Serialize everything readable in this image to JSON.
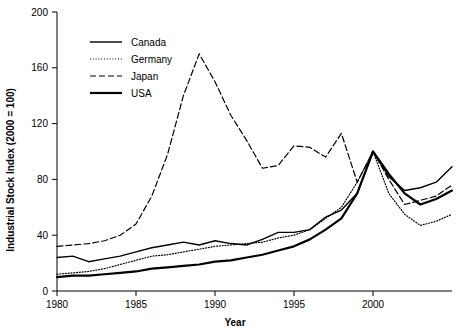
{
  "chart_data": {
    "type": "line",
    "title": "",
    "xlabel": "Year",
    "ylabel": "Industrial Stock Index (2000 = 100)",
    "xlim": [
      1980,
      2005
    ],
    "ylim": [
      0,
      200
    ],
    "xticks": [
      1980,
      1985,
      1990,
      1995,
      2000
    ],
    "yticks": [
      0,
      40,
      80,
      120,
      160,
      200
    ],
    "grid": false,
    "legend_position": "top-left",
    "x": [
      1980,
      1981,
      1982,
      1983,
      1984,
      1985,
      1986,
      1987,
      1988,
      1989,
      1990,
      1991,
      1992,
      1993,
      1994,
      1995,
      1996,
      1997,
      1998,
      1999,
      2000,
      2001,
      2002,
      2003,
      2004,
      2005
    ],
    "series": [
      {
        "name": "Canada",
        "style": "solid",
        "values": [
          24,
          25,
          21,
          23,
          25,
          28,
          31,
          33,
          35,
          33,
          36,
          34,
          33,
          37,
          42,
          42,
          44,
          53,
          58,
          70,
          100,
          82,
          72,
          74,
          78,
          89
        ]
      },
      {
        "name": "Germany",
        "style": "dotted",
        "values": [
          12,
          13,
          14,
          16,
          19,
          22,
          25,
          26,
          28,
          30,
          32,
          33,
          34,
          35,
          38,
          40,
          44,
          52,
          60,
          78,
          100,
          70,
          55,
          47,
          50,
          55
        ]
      },
      {
        "name": "Japan",
        "style": "dashed",
        "values": [
          32,
          33,
          34,
          36,
          40,
          48,
          68,
          98,
          140,
          170,
          150,
          126,
          108,
          88,
          90,
          104,
          103,
          96,
          113,
          78,
          100,
          80,
          62,
          65,
          68,
          76
        ]
      },
      {
        "name": "USA",
        "style": "solid-thick",
        "values": [
          10,
          11,
          11,
          12,
          13,
          14,
          16,
          17,
          18,
          19,
          21,
          22,
          24,
          26,
          29,
          32,
          37,
          44,
          52,
          70,
          100,
          84,
          70,
          62,
          66,
          72
        ]
      }
    ]
  },
  "legend": {
    "items": [
      {
        "label": "Canada"
      },
      {
        "label": "Germany"
      },
      {
        "label": "Japan"
      },
      {
        "label": "USA"
      }
    ]
  }
}
